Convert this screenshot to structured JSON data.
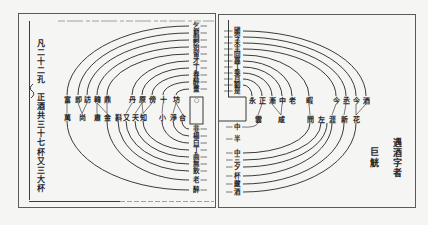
{
  "document": {
    "left_page": {
      "heading_column": "凡二十二孔",
      "note_column": "正酒共三十七杯又三大杯",
      "center_marker": "○",
      "upper_column": [
        "乞",
        "窮",
        "嗣",
        "始",
        "留",
        "才",
        "丁",
        "春",
        "醉",
        "畫"
      ],
      "top_row": [
        "富",
        "即",
        "訪",
        "韓",
        "鼎",
        "丹",
        "原",
        "傍",
        "十",
        "坊"
      ],
      "bottom_row": [
        "萬",
        "尚",
        "肅",
        "金",
        "斟",
        "又",
        "天",
        "知",
        "小",
        "淨",
        "合"
      ],
      "lower_column": [
        "非",
        "楊",
        "白",
        "丁",
        "曲",
        "無",
        "飲",
        "老",
        "醉"
      ]
    },
    "right_page": {
      "upper_column": [
        "國",
        "今",
        "未",
        "主",
        "回",
        "尋",
        "丁",
        "乘",
        "月",
        "劉",
        "是"
      ],
      "top_row": [
        "永",
        "正",
        "漸",
        "中",
        "老",
        "暇",
        "今",
        "丞",
        "今",
        "酒"
      ],
      "bottom_row": [
        "雲",
        "咸",
        "問",
        "左",
        "涯",
        "新",
        "花"
      ],
      "lower_column": [
        "中",
        "半",
        "中",
        "三",
        "夕",
        "杯",
        "藏",
        "酒"
      ],
      "note_column": "遇酒字者",
      "note_column_2": "巨觥"
    }
  },
  "colors": {
    "ink": "#262626",
    "paper": "#f5f5f3",
    "frame": "#5a5a5a"
  }
}
